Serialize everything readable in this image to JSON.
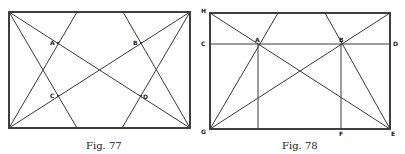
{
  "figures": [
    {
      "caption": "Fig. 77",
      "labels": {
        "A": "A",
        "B": "B",
        "C": "C",
        "D": "D"
      }
    },
    {
      "caption": "Fig. 78",
      "labels": {
        "H": "H",
        "C": "C",
        "A": "A",
        "B": "B",
        "D": "D",
        "G": "G",
        "F": "F",
        "E": "E"
      }
    }
  ],
  "colors": {
    "ink": "#2a2a2a",
    "paper": "#ffffff"
  }
}
